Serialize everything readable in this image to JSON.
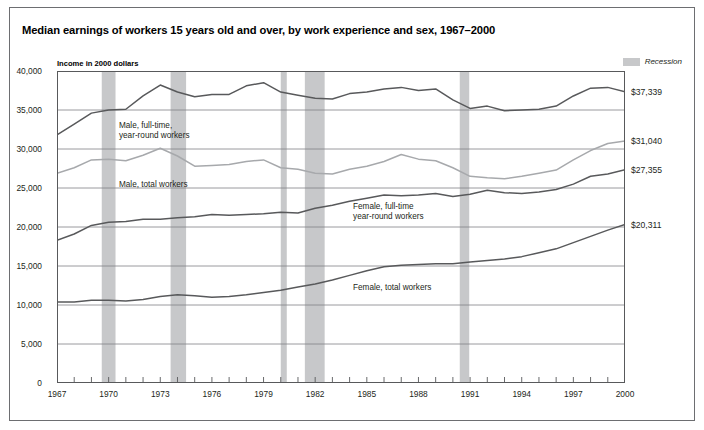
{
  "title": "Median earnings of workers 15 years old and over, by work experience and sex, 1967–2000",
  "axis_note": "Income in 2000 dollars",
  "legend": {
    "swatch_color": "#c7c8ca",
    "label": "Recession"
  },
  "colors": {
    "dark_line": "#58595b",
    "light_line": "#a7a9ac",
    "recession_band": "#c7c8ca",
    "grid": "#808285",
    "frame": "#58595b",
    "outer_frame": "#6d6e71"
  },
  "chart_data": {
    "type": "line",
    "title": "Median earnings of workers 15 years old and over, by work experience and sex, 1967–2000",
    "xlabel": "",
    "ylabel": "Income in 2000 dollars",
    "xlim": [
      1967,
      2000
    ],
    "ylim": [
      0,
      40000
    ],
    "grid": true,
    "legend_position": "inline-annotations",
    "ytick_labels": [
      "0",
      "5,000",
      "10,000",
      "15,000",
      "20,000",
      "25,000",
      "30,000",
      "35,000",
      "40,000"
    ],
    "ytick_values": [
      0,
      5000,
      10000,
      15000,
      20000,
      25000,
      30000,
      35000,
      40000
    ],
    "xtick_labels": [
      "1967",
      "1970",
      "1973",
      "1976",
      "1979",
      "1982",
      "1985",
      "1988",
      "1991",
      "1994",
      "1997",
      "2000"
    ],
    "xtick_values": [
      1967,
      1970,
      1973,
      1976,
      1979,
      1982,
      1985,
      1988,
      1991,
      1994,
      1997,
      2000
    ],
    "x": [
      1967,
      1968,
      1969,
      1970,
      1971,
      1972,
      1973,
      1974,
      1975,
      1976,
      1977,
      1978,
      1979,
      1980,
      1981,
      1982,
      1983,
      1984,
      1985,
      1986,
      1987,
      1988,
      1989,
      1990,
      1991,
      1992,
      1993,
      1994,
      1995,
      1996,
      1997,
      1998,
      1999,
      2000
    ],
    "series": [
      {
        "name": "Male, full-time, year-round workers",
        "color": "#58595b",
        "end_value_label": "$37,339",
        "values": [
          31800,
          33200,
          34600,
          35000,
          35100,
          36800,
          38200,
          37300,
          36700,
          37000,
          37000,
          38100,
          38500,
          37300,
          36900,
          36500,
          36400,
          37100,
          37300,
          37700,
          37900,
          37500,
          37700,
          36300,
          35200,
          35500,
          34900,
          35000,
          35100,
          35500,
          36800,
          37800,
          37900,
          37339
        ]
      },
      {
        "name": "Male, total workers",
        "color": "#a7a9ac",
        "end_value_label": "$31,040",
        "values": [
          26900,
          27600,
          28600,
          28700,
          28500,
          29200,
          30100,
          29100,
          27800,
          27900,
          28000,
          28400,
          28600,
          27600,
          27400,
          26900,
          26800,
          27400,
          27800,
          28400,
          29300,
          28700,
          28500,
          27600,
          26500,
          26300,
          26200,
          26500,
          26900,
          27300,
          28600,
          29800,
          30700,
          31040
        ]
      },
      {
        "name": "Female, full-time year-round workers",
        "color": "#58595b",
        "end_value_label": "$27,355",
        "values": [
          18300,
          19100,
          20200,
          20600,
          20700,
          21000,
          21000,
          21200,
          21300,
          21600,
          21500,
          21600,
          21700,
          21900,
          21800,
          22400,
          22800,
          23300,
          23700,
          24100,
          24000,
          24100,
          24300,
          23900,
          24200,
          24700,
          24400,
          24300,
          24500,
          24800,
          25500,
          26500,
          26800,
          27355
        ]
      },
      {
        "name": "Female, total workers",
        "color": "#58595b",
        "end_value_label": "$20,311",
        "values": [
          10400,
          10400,
          10600,
          10600,
          10500,
          10700,
          11100,
          11300,
          11200,
          11000,
          11100,
          11300,
          11600,
          11900,
          12300,
          12700,
          13200,
          13800,
          14400,
          14900,
          15100,
          15200,
          15300,
          15300,
          15500,
          15700,
          15900,
          16200,
          16700,
          17200,
          18000,
          18800,
          19600,
          20311
        ]
      }
    ],
    "annotations": [
      {
        "text": "Male, full-time,\nyear-round workers",
        "x": 1970.6,
        "y": 33600
      },
      {
        "text": "Male, total workers",
        "x": 1970.6,
        "y": 26000
      },
      {
        "text": "Female, full-time\nyear-round workers",
        "x": 1984.2,
        "y": 23200
      },
      {
        "text": "Female, total workers",
        "x": 1984.2,
        "y": 12800
      }
    ],
    "recession_bands": [
      {
        "start": 1969.6,
        "end": 1970.4
      },
      {
        "start": 1973.6,
        "end": 1974.5
      },
      {
        "start": 1980.0,
        "end": 1980.35
      },
      {
        "start": 1981.4,
        "end": 1982.55
      },
      {
        "start": 1990.4,
        "end": 1990.95
      }
    ]
  }
}
